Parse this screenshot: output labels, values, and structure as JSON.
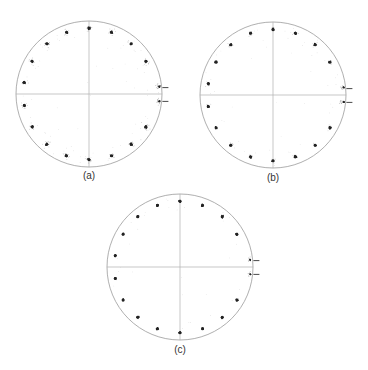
{
  "chart_data": [
    {
      "type": "scatter",
      "title": "",
      "panel_label": "(a)",
      "description": "Polar constellation diagram with crosshair axes; 18 symbol clusters evenly spaced around the circle plus a split pair near 0°",
      "cluster_angles_deg": [
        -10,
        -30,
        -50,
        -70,
        -90,
        -110,
        -130,
        -150,
        -170,
        170,
        150,
        130,
        110,
        90,
        70,
        50,
        30,
        10
      ],
      "cluster_radius_fraction": 0.9,
      "edge_markers_deg": [
        6,
        -6
      ],
      "scatter_noise": "moderate"
    },
    {
      "type": "scatter",
      "title": "",
      "panel_label": "(b)",
      "description": "Polar constellation diagram with crosshair axes; tighter clusters, split pair near 0°",
      "cluster_angles_deg": [
        -10,
        -30,
        -50,
        -70,
        -90,
        -110,
        -130,
        -150,
        -170,
        170,
        150,
        130,
        110,
        90,
        70,
        50,
        30,
        10
      ],
      "cluster_radius_fraction": 0.9,
      "edge_markers_deg": [
        6,
        -6
      ],
      "scatter_noise": "low"
    },
    {
      "type": "scatter",
      "title": "",
      "panel_label": "(c)",
      "description": "Polar constellation diagram with crosshair axes; tightest clusters, split pair near 0°",
      "cluster_angles_deg": [
        -10,
        -30,
        -50,
        -70,
        -90,
        -110,
        -130,
        -150,
        -170,
        170,
        150,
        130,
        110,
        90,
        70,
        50,
        30,
        10
      ],
      "cluster_radius_fraction": 0.9,
      "edge_markers_deg": [
        6,
        -6
      ],
      "scatter_noise": "very-low"
    }
  ]
}
